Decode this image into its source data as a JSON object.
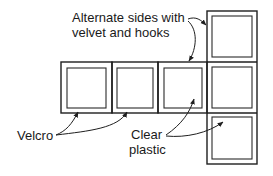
{
  "diagram": {
    "type": "cube-net",
    "labels": {
      "alternate_line1": "Alternate sides with",
      "alternate_line2": "velvet and hooks",
      "velcro": "Velcro",
      "clear_line1": "Clear",
      "clear_line2": "plastic"
    },
    "panels": [
      {
        "id": "row-1",
        "x": 61,
        "y": 62,
        "w": 51,
        "h": 51
      },
      {
        "id": "row-2",
        "x": 112,
        "y": 62,
        "w": 46,
        "h": 51
      },
      {
        "id": "row-3",
        "x": 158,
        "y": 62,
        "w": 49,
        "h": 51
      },
      {
        "id": "col-top",
        "x": 207,
        "y": 11,
        "w": 50,
        "h": 51
      },
      {
        "id": "col-middle",
        "x": 207,
        "y": 62,
        "w": 50,
        "h": 51
      },
      {
        "id": "col-bottom",
        "x": 207,
        "y": 113,
        "w": 50,
        "h": 51
      }
    ],
    "colors": {
      "line": "#1f1f1f",
      "background": "#ffffff"
    }
  }
}
